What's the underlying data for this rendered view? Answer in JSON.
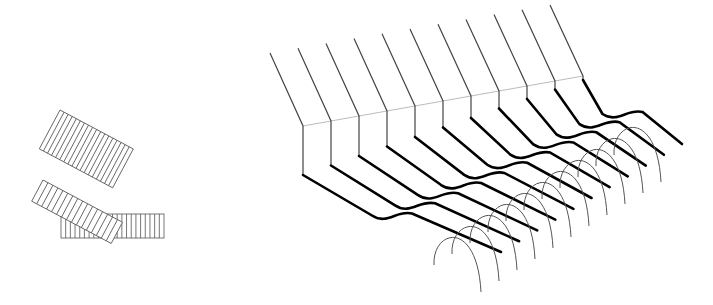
{
  "figure": {
    "background": "#ffffff",
    "stroke_color": "#000000",
    "thin_stroke_color": "#555555",
    "guide_color": "#aaaaaa"
  },
  "left_panel": {
    "description": "stack of striped rectangles (flat cable ribbons) folded at an angle",
    "ribbons": [
      {
        "name": "top-ribbon",
        "stripes": 18,
        "angle_deg": 28
      },
      {
        "name": "middle-ribbon",
        "stripes": 16,
        "angle_deg": 28
      },
      {
        "name": "bottom-ribbon",
        "stripes": 22,
        "angle_deg": 0
      }
    ],
    "filled_region": "black triangle at fold"
  },
  "right_panel": {
    "description": "11 wires bent and crossing a series of arches",
    "wire_count": 11,
    "arch_count": 11
  }
}
